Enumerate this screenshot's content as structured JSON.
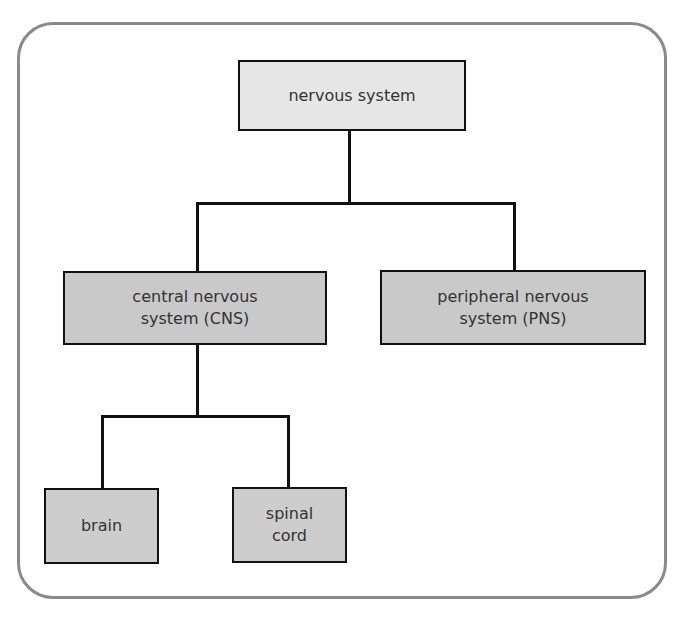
{
  "diagram": {
    "type": "hierarchy",
    "colors": {
      "frame_border": "#8a8a8a",
      "root_fill": "#e6e6e6",
      "child_fill": "#c9c9c9",
      "line": "#111111"
    },
    "nodes": {
      "root": {
        "label": "nervous system"
      },
      "cns": {
        "label_line1": "central nervous",
        "label_line2": "system (CNS)"
      },
      "pns": {
        "label_line1": "peripheral nervous",
        "label_line2": "system (PNS)"
      },
      "brain": {
        "label": "brain"
      },
      "spinal_cord": {
        "label_line1": "spinal",
        "label_line2": "cord"
      }
    },
    "edges": [
      {
        "from": "nervous system",
        "to": "central nervous system (CNS)"
      },
      {
        "from": "nervous system",
        "to": "peripheral nervous system (PNS)"
      },
      {
        "from": "central nervous system (CNS)",
        "to": "brain"
      },
      {
        "from": "central nervous system (CNS)",
        "to": "spinal cord"
      }
    ]
  }
}
